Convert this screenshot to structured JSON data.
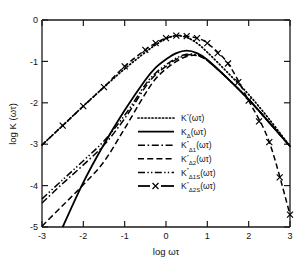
{
  "figure": {
    "background": "#ffffff",
    "ink_color": "#000000"
  },
  "axes": {
    "x": {
      "label": "log ωτ",
      "ticks": [
        "-3",
        "-2",
        "-1",
        "0",
        "1",
        "2",
        "3"
      ],
      "range": [
        -3,
        3
      ]
    },
    "y": {
      "label": "log K (ωτ)",
      "ticks": [
        "0",
        "-1",
        "-2",
        "-3",
        "-4",
        "-5"
      ],
      "range": [
        -5,
        0
      ]
    }
  },
  "legend": {
    "position": "center-lower",
    "entries": [
      {
        "key": "Kpp",
        "sample": "dotted",
        "base": "K",
        "sup": "″",
        "sub": "",
        "arg": "(ωτ)",
        "label": "K″(ωτ)"
      },
      {
        "key": "KD",
        "sample": "solid",
        "base": "K",
        "sup": "",
        "sub": "Δ",
        "arg": "(ωτ)",
        "label": "KΔ(ωτ)"
      },
      {
        "key": "KD1",
        "sample": "dashdot",
        "base": "K",
        "sup": "″",
        "sub": "Δ1",
        "arg": "(ωτ)",
        "label": "K″Δ1(ωτ)"
      },
      {
        "key": "KD2",
        "sample": "dashed",
        "base": "K",
        "sup": "″",
        "sub": "Δ2",
        "arg": "(ωτ)",
        "label": "K″Δ2(ωτ)"
      },
      {
        "key": "KD1S",
        "sample": "dashdotdot",
        "base": "K",
        "sup": "″",
        "sub": "Δ1S",
        "arg": "(ωτ)",
        "label": "K″Δ1S(ωτ)"
      },
      {
        "key": "KD2S",
        "sample": "solid-marker-x",
        "base": "K",
        "sup": "″",
        "sub": "Δ2S",
        "arg": "(ωτ)",
        "label": "K″Δ2S(ωτ)"
      }
    ]
  },
  "chart_data": {
    "type": "line",
    "title": "",
    "xlabel": "log ωτ",
    "ylabel": "log K (ωτ)",
    "xlim": [
      -3,
      3
    ],
    "ylim": [
      -5,
      0
    ],
    "grid": false,
    "legend_position": "center",
    "x": [
      -3,
      -2.5,
      -2,
      -1.5,
      -1,
      -0.5,
      -0.25,
      0,
      0.25,
      0.5,
      0.75,
      1,
      1.5,
      2,
      2.5,
      3
    ],
    "series": [
      {
        "name": "K″(ωτ)",
        "style": "dotted",
        "values": [
          -3.02,
          -2.55,
          -2.08,
          -1.62,
          -1.18,
          -0.78,
          -0.6,
          -0.45,
          -0.38,
          -0.42,
          -0.56,
          -0.78,
          -1.28,
          -1.8,
          -2.4,
          -3.05
        ]
      },
      {
        "name": "KΔ(ωτ)",
        "style": "solid",
        "values": [
          -9.2,
          -5.0,
          -3.92,
          -3.0,
          -2.18,
          -1.45,
          -1.15,
          -0.95,
          -0.8,
          -0.74,
          -0.8,
          -0.96,
          -1.42,
          -1.92,
          -2.48,
          -3.05
        ]
      },
      {
        "name": "K″Δ1(ωτ)",
        "style": "dashdot",
        "values": [
          -4.42,
          -3.95,
          -3.5,
          -3.02,
          -2.38,
          -1.62,
          -1.32,
          -1.12,
          -0.95,
          -0.85,
          -0.85,
          -0.98,
          -1.42,
          -1.92,
          -2.48,
          -3.05
        ]
      },
      {
        "name": "K″Δ2(ωτ)",
        "style": "dashed",
        "values": [
          -4.98,
          -4.48,
          -3.98,
          -3.42,
          -2.62,
          -1.78,
          -1.42,
          -1.18,
          -1.0,
          -0.88,
          -0.86,
          -0.98,
          -1.42,
          -1.92,
          -2.48,
          -3.05
        ]
      },
      {
        "name": "K″Δ1S(ωτ)",
        "style": "dashdotdot",
        "values": [
          -4.32,
          -3.86,
          -3.4,
          -2.92,
          -2.3,
          -1.56,
          -1.28,
          -1.08,
          -0.92,
          -0.83,
          -0.84,
          -0.97,
          -1.42,
          -1.92,
          -2.48,
          -3.05
        ]
      },
      {
        "name": "K″Δ2S(ωτ)",
        "style": "solid-marker-x",
        "markers": true,
        "marker": "x",
        "values": [
          -3.02,
          -2.55,
          -2.08,
          -1.62,
          -1.12,
          -0.72,
          -0.56,
          -0.44,
          -0.38,
          -0.39,
          -0.44,
          -0.56,
          -1.05,
          -1.95,
          -2.95,
          -4.7
        ]
      }
    ],
    "marker_series_x": [
      -2.5,
      -2,
      -1.5,
      -1,
      -0.5,
      -0.25,
      0,
      0.25,
      0.5,
      0.75,
      1,
      1.25,
      1.5,
      1.75,
      2,
      2.25,
      2.5,
      2.75,
      3
    ],
    "marker_series_y": [
      -2.55,
      -2.08,
      -1.62,
      -1.12,
      -0.72,
      -0.56,
      -0.44,
      -0.38,
      -0.39,
      -0.44,
      -0.56,
      -0.8,
      -1.05,
      -1.5,
      -1.95,
      -2.45,
      -2.95,
      -3.8,
      -4.7
    ]
  }
}
